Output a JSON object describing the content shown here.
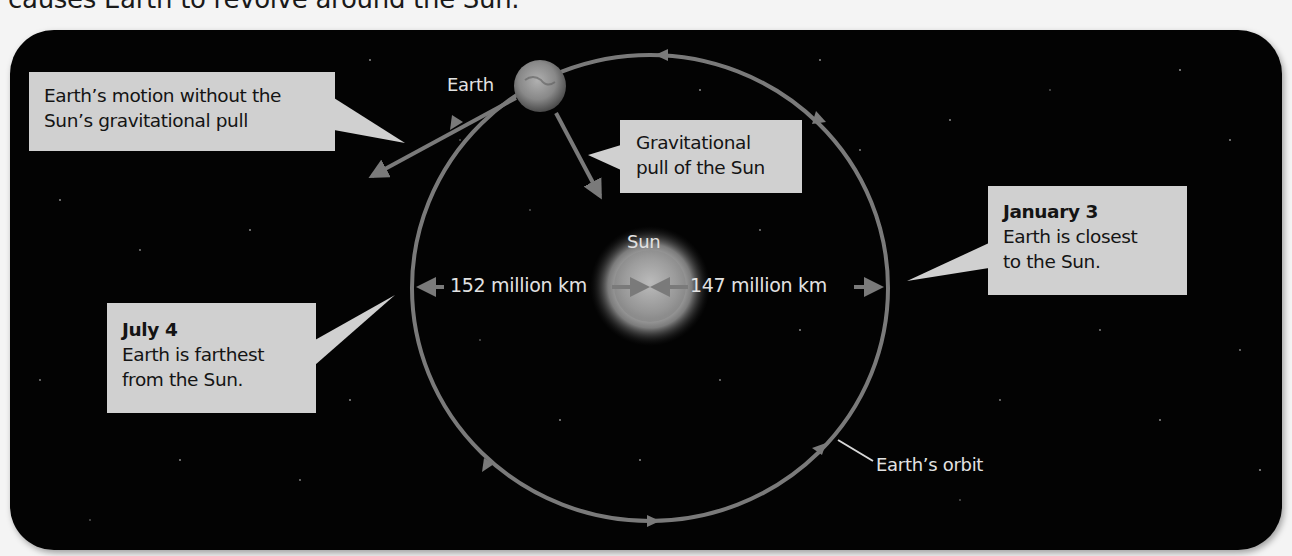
{
  "caption": "causes Earth to revolve around the Sun.",
  "diagram": {
    "title_context": "Earth's orbit around the Sun",
    "bodies": {
      "earth_label": "Earth",
      "sun_label": "Sun"
    },
    "callouts": {
      "inertia": {
        "lines": [
          "Earth’s motion without the",
          "Sun’s gravitational pull"
        ]
      },
      "gravity": {
        "lines": [
          "Gravitational",
          "pull of the Sun"
        ]
      },
      "perihelion": {
        "heading": "January 3",
        "lines": [
          "Earth is closest",
          "to the Sun."
        ]
      },
      "aphelion": {
        "heading": "July 4",
        "lines": [
          "Earth is farthest",
          "from the Sun."
        ]
      }
    },
    "distances": {
      "aphelion_distance": "152 million km",
      "perihelion_distance": "147 million km"
    },
    "orbit_label": "Earth’s orbit",
    "colors": {
      "background": "#030303",
      "orbit": "#7a7a7a",
      "callout_fill": "#d0d0d0",
      "label_text": "#e2e2e2"
    }
  }
}
